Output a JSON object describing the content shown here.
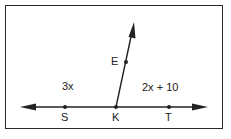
{
  "diagram": {
    "points": [
      {
        "name": "S",
        "x": 65,
        "y": 107
      },
      {
        "name": "K",
        "x": 116,
        "y": 107
      },
      {
        "name": "T",
        "x": 169,
        "y": 107
      },
      {
        "name": "E",
        "x": 126,
        "y": 62
      }
    ],
    "angle_labels": {
      "left": "3x",
      "right": "2x + 10"
    },
    "point_labels": {
      "S": "S",
      "K": "K",
      "T": "T",
      "E": "E"
    },
    "line": {
      "from": [
        20,
        107
      ],
      "to": [
        208,
        107
      ]
    },
    "ray": {
      "from": [
        116,
        107
      ],
      "to": [
        134,
        22
      ]
    },
    "color": "#222222"
  }
}
